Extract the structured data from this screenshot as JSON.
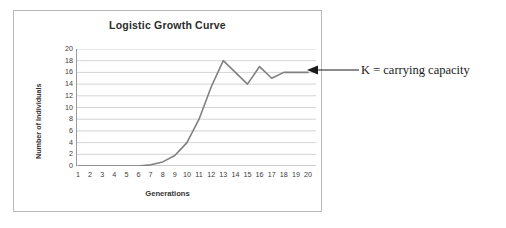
{
  "chart_data": {
    "type": "line",
    "title": "Logistic Growth Curve",
    "xlabel": "Generations",
    "ylabel": "Number of Individuals",
    "xlim": [
      1,
      20
    ],
    "ylim": [
      0,
      20
    ],
    "y_ticks": [
      0,
      2,
      4,
      6,
      8,
      10,
      12,
      14,
      16,
      18,
      20
    ],
    "x_ticks": [
      1,
      2,
      3,
      4,
      5,
      6,
      7,
      8,
      9,
      10,
      11,
      12,
      13,
      14,
      15,
      16,
      17,
      18,
      19,
      20
    ],
    "grid": "horizontal",
    "legend": "none",
    "series": [
      {
        "name": "Population",
        "color": "#808080",
        "x": [
          1,
          2,
          3,
          4,
          5,
          6,
          7,
          8,
          9,
          10,
          11,
          12,
          13,
          14,
          15,
          16,
          17,
          18,
          19,
          20
        ],
        "values": [
          0,
          0,
          0,
          0,
          0,
          0,
          0.2,
          0.7,
          1.8,
          4,
          8,
          13.5,
          18,
          16,
          14,
          17,
          15,
          16,
          16,
          16
        ]
      }
    ],
    "annotations": [
      {
        "text": "K = carrying capacity",
        "arrow": "left-arrow-icon",
        "points_to_value": 16
      }
    ]
  },
  "colors": {
    "curve": "#808080",
    "gridline": "#c8c8c8",
    "axis": "#9a9a9a",
    "frame": "#b9b9b9",
    "title_text": "#2b2b2b",
    "tick_text": "#3b3b3b",
    "annotation_text": "#1a1a1a"
  }
}
